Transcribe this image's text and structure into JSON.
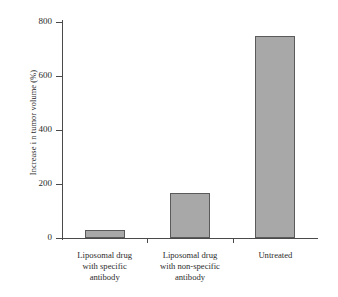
{
  "chart_data": {
    "type": "bar",
    "title": "",
    "xlabel": "",
    "ylabel": "Increase i n tumor volume (%)",
    "categories": [
      "Liposomal drug with specific antibody",
      "Liposomal drug with non-specific antibody",
      "Untreated"
    ],
    "category_lines": [
      [
        "Liposomal drug",
        "with specific",
        "antibody"
      ],
      [
        "Liposomal drug",
        "with non-specific",
        "antibody"
      ],
      [
        "Untreated"
      ]
    ],
    "values": [
      30,
      165,
      748
    ],
    "ylim": [
      0,
      800
    ],
    "yticks": [
      0,
      200,
      400,
      600,
      800
    ],
    "ytick_labels": [
      "0",
      "200",
      "400",
      "600",
      "800"
    ],
    "grid": false,
    "legend": "none",
    "bar_fill_color": "#a8a8a8",
    "bar_edge_color": "#5a5a5a",
    "axis_color": "#4a4a4a"
  }
}
